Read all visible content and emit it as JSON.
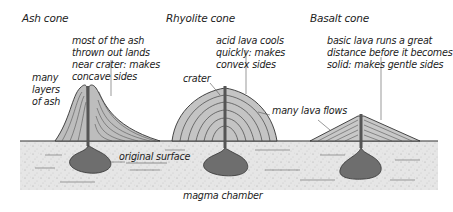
{
  "cones": [
    {
      "title": "Ash cone",
      "notes": [
        "most of the ash",
        "thrown out lands",
        "near crater: makes",
        "concave sides"
      ],
      "side_label": [
        "many",
        "layers",
        "of ash"
      ]
    },
    {
      "title": "Rhyolite cone",
      "notes": [
        "acid lava cools",
        "quickly: makes",
        "convex sides"
      ],
      "crater_label": "crater",
      "flows_label": "many lava flows"
    },
    {
      "title": "Basalt cone",
      "notes": [
        "basic lava runs a great",
        "distance before it becomes",
        "solid: makes gentle sides"
      ]
    }
  ],
  "ground": {
    "surface_label": "original surface",
    "chamber_label": "magma chamber"
  },
  "colors": {
    "ground": "#e4e4e4",
    "magma": "#6e6e6e",
    "layer_light": "#d0d0d0",
    "layer_dark": "#9a9a9a",
    "outline": "#333333"
  }
}
